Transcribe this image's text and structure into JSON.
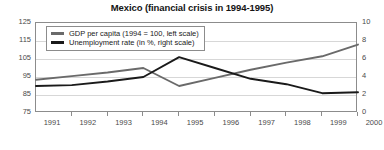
{
  "chart_data": {
    "type": "line",
    "title": "Mexico (financial crisis in 1994-1995)",
    "xlabel": "",
    "ylabel": "",
    "grid": true,
    "legend_position": "top-left-inside",
    "x": [
      1991,
      1992,
      1993,
      1994,
      1995,
      1996,
      1997,
      1998,
      1999,
      2000
    ],
    "xticklabels": [
      "1991",
      "1992",
      "1993",
      "1994",
      "1995",
      "1996",
      "1997",
      "1998",
      "1999",
      "2000"
    ],
    "left_axis": {
      "ylim": [
        75,
        125
      ],
      "yticks": [
        75,
        85,
        95,
        105,
        115,
        125
      ],
      "yticklabels": [
        "75",
        "85",
        "95",
        "105",
        "115",
        "125"
      ]
    },
    "right_axis": {
      "ylim": [
        0,
        10
      ],
      "yticks": [
        0,
        2,
        4,
        6,
        8,
        10
      ],
      "yticklabels": [
        "0",
        "2",
        "4",
        "6",
        "8",
        "10"
      ]
    },
    "series": [
      {
        "name": "GDP per capita (1994 = 100, left scale)",
        "axis": "left",
        "color": "#6a6a6a",
        "values": [
          93.5,
          95.5,
          97.5,
          100.0,
          90.0,
          94.5,
          99.0,
          103.0,
          106.5,
          113.0
        ]
      },
      {
        "name": "Unemployment rate (in %, right scale)",
        "axis": "right",
        "color": "#1a1a1a",
        "values": [
          3.0,
          3.1,
          3.5,
          4.0,
          6.2,
          5.0,
          3.8,
          3.2,
          2.2,
          2.3
        ]
      }
    ]
  },
  "legend": {
    "items": [
      {
        "label": "GDP per capita (1994 = 100, left scale)",
        "color": "#6a6a6a"
      },
      {
        "label": "Unemployment rate (in %, right scale)",
        "color": "#1a1a1a"
      }
    ]
  }
}
